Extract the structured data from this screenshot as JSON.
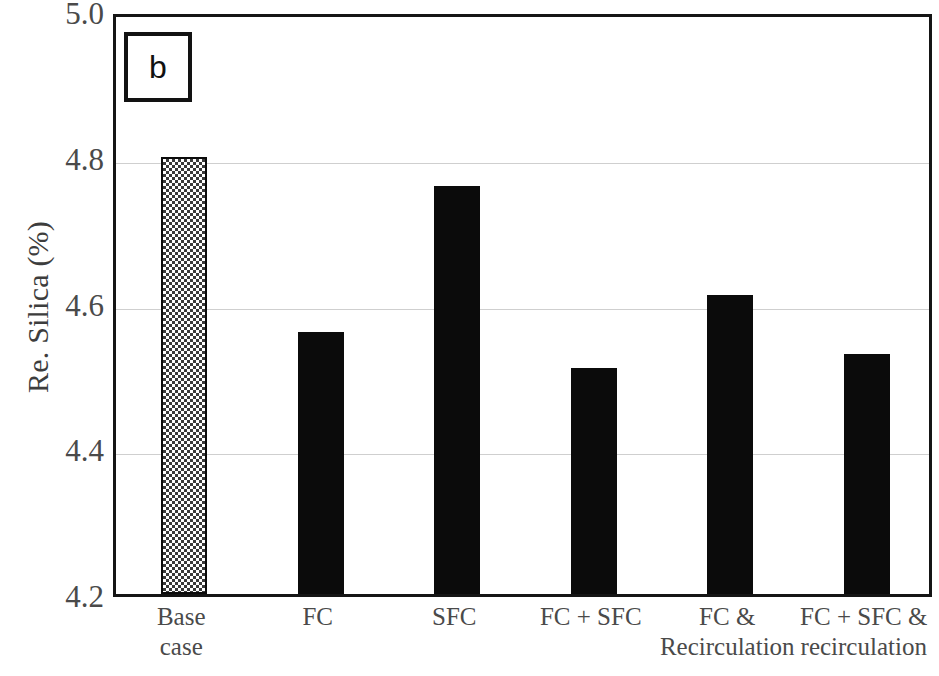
{
  "chart_data": {
    "type": "bar",
    "title": "",
    "panel_label": "b",
    "xlabel": "",
    "ylabel": "Re. Silica (%)",
    "ylim": [
      4.2,
      5.0
    ],
    "ytick_labels": [
      "5.0",
      "4.8",
      "4.6",
      "4.4",
      "4.2"
    ],
    "ytick_values": [
      5.0,
      4.8,
      4.6,
      4.4,
      4.2
    ],
    "grid": true,
    "grid_axis": "y",
    "legend": false,
    "categories": [
      "Base\ncase",
      "FC",
      "SFC",
      "FC + SFC",
      "FC &\nRecirculation",
      "FC + SFC &\nrecirculation"
    ],
    "values": [
      4.8,
      4.56,
      4.76,
      4.51,
      4.61,
      4.53
    ],
    "bar_styles": [
      "checker",
      "solid",
      "solid",
      "solid",
      "solid",
      "solid"
    ],
    "colors": {
      "bar_solid": "#0b0b0b",
      "bar_checker_fill": "#3a3a3a",
      "bar_checker_background": "#ffffff",
      "axis": "#151515",
      "grid": "#cfcfcf",
      "text": "#4a4a4a",
      "background": "#ffffff"
    }
  },
  "axis": {
    "y_title": "Re. Silica (%)"
  },
  "panel": {
    "label": "b"
  }
}
